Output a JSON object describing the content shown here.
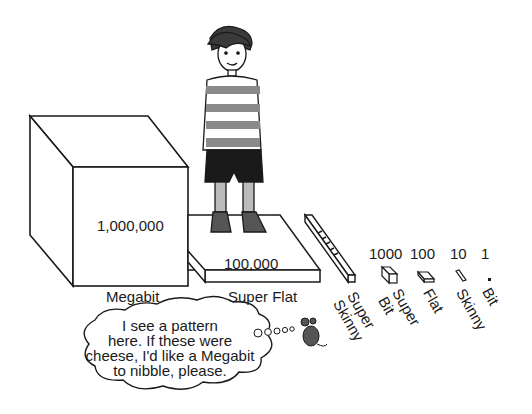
{
  "blocks": [
    {
      "id": "megabit",
      "name": "Megabit",
      "value": "1,000,000"
    },
    {
      "id": "super-flat",
      "name": "Super Flat",
      "value": "100,000"
    },
    {
      "id": "super-skinny",
      "name": "Super Skinny",
      "value": "10,000"
    },
    {
      "id": "super-bit",
      "name": "Super Bit",
      "value": "1000"
    },
    {
      "id": "flat",
      "name": "Flat",
      "value": "100"
    },
    {
      "id": "skinny",
      "name": "Skinny",
      "value": "10"
    },
    {
      "id": "bit",
      "name": "Bit",
      "value": "1"
    }
  ],
  "rotated_labels": {
    "super_skinny_line1": "Super",
    "super_skinny_line2": "Skinny",
    "super_bit_line1": "Super",
    "super_bit_line2": "Bit",
    "flat": "Flat",
    "skinny": "Skinny",
    "bit": "Bit"
  },
  "thought_bubble": {
    "lines": [
      "I see a pattern",
      "here.  If these were",
      "cheese, I'd like a Megabit",
      "to nibble, please."
    ]
  },
  "colors": {
    "line": "#1a1a1a",
    "stripe": "#8a8a8a",
    "shorts": "#1a1a1a",
    "mouse": "#555555"
  }
}
